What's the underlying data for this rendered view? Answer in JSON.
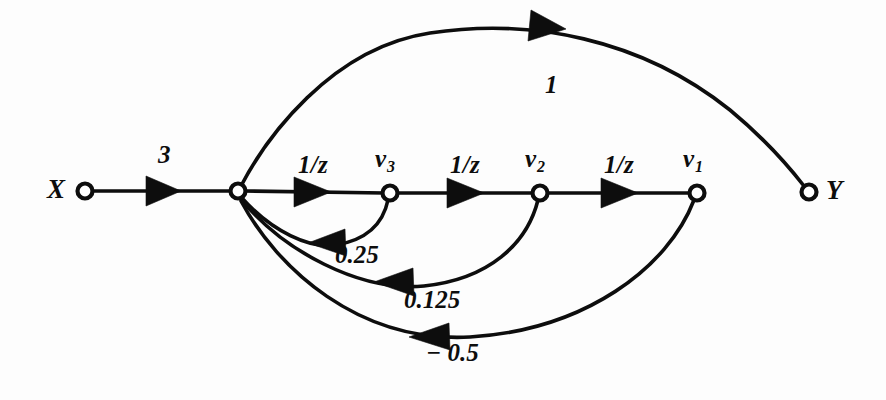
{
  "diagram": {
    "kind": "signal-flow-graph",
    "background_color": "#fdfdfd",
    "ink_color": "#0d0d0d",
    "nodes": [
      {
        "id": "X",
        "label": "X",
        "label_sub": "",
        "x": 85,
        "y": 191,
        "label_x": 47,
        "label_y": 176
      },
      {
        "id": "J",
        "label": "",
        "label_sub": "",
        "x": 238,
        "y": 191,
        "label_x": 0,
        "label_y": 0
      },
      {
        "id": "v3",
        "label": "v",
        "label_sub": "3",
        "x": 390,
        "y": 193,
        "label_x": 375,
        "label_y": 146
      },
      {
        "id": "v2",
        "label": "v",
        "label_sub": "2",
        "x": 540,
        "y": 193,
        "label_x": 525,
        "label_y": 146
      },
      {
        "id": "v1",
        "label": "v",
        "label_sub": "1",
        "x": 697,
        "y": 193,
        "label_x": 683,
        "label_y": 146
      },
      {
        "id": "Y",
        "label": "Y",
        "label_sub": "",
        "x": 809,
        "y": 192,
        "label_x": 826,
        "label_y": 177
      }
    ],
    "edges": [
      {
        "id": "x-to-j",
        "from": "X",
        "to": "J",
        "gain": "3",
        "gain_x": 158,
        "gain_y": 142,
        "direction": "right"
      },
      {
        "id": "j-to-v3",
        "from": "J",
        "to": "v3",
        "gain": "1/z",
        "gain_x": 298,
        "gain_y": 152,
        "direction": "right"
      },
      {
        "id": "v3-to-v2",
        "from": "v3",
        "to": "v2",
        "gain": "1/z",
        "gain_x": 450,
        "gain_y": 152,
        "direction": "right"
      },
      {
        "id": "v2-to-v1",
        "from": "v2",
        "to": "v1",
        "gain": "1/z",
        "gain_x": 604,
        "gain_y": 152,
        "direction": "right"
      },
      {
        "id": "j-to-y",
        "from": "J",
        "to": "Y",
        "gain": "1",
        "gain_x": 545,
        "gain_y": 72,
        "direction": "right"
      },
      {
        "id": "v3-to-j",
        "from": "v3",
        "to": "J",
        "gain": "0.25",
        "gain_x": 335,
        "gain_y": 242,
        "direction": "left"
      },
      {
        "id": "v2-to-j",
        "from": "v2",
        "to": "J",
        "gain": "0.125",
        "gain_x": 404,
        "gain_y": 287,
        "direction": "left"
      },
      {
        "id": "v1-to-j",
        "from": "v1",
        "to": "J",
        "gain": "− 0.5",
        "gain_x": 426,
        "gain_y": 340,
        "direction": "left"
      }
    ]
  }
}
